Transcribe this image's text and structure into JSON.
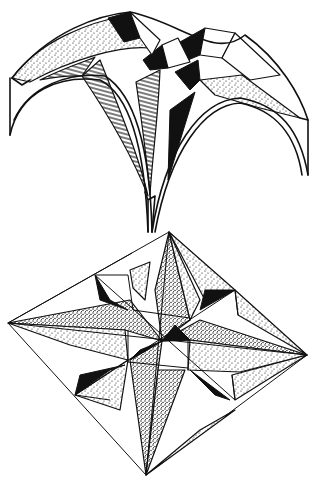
{
  "figure": {
    "ink_color": "#111111",
    "paper_color": "#ffffff",
    "parts": [
      {
        "id": "vault",
        "label": "Stellar vault (elevated view)"
      },
      {
        "id": "plan",
        "label": "Star vault plan (rhombus)"
      }
    ]
  }
}
